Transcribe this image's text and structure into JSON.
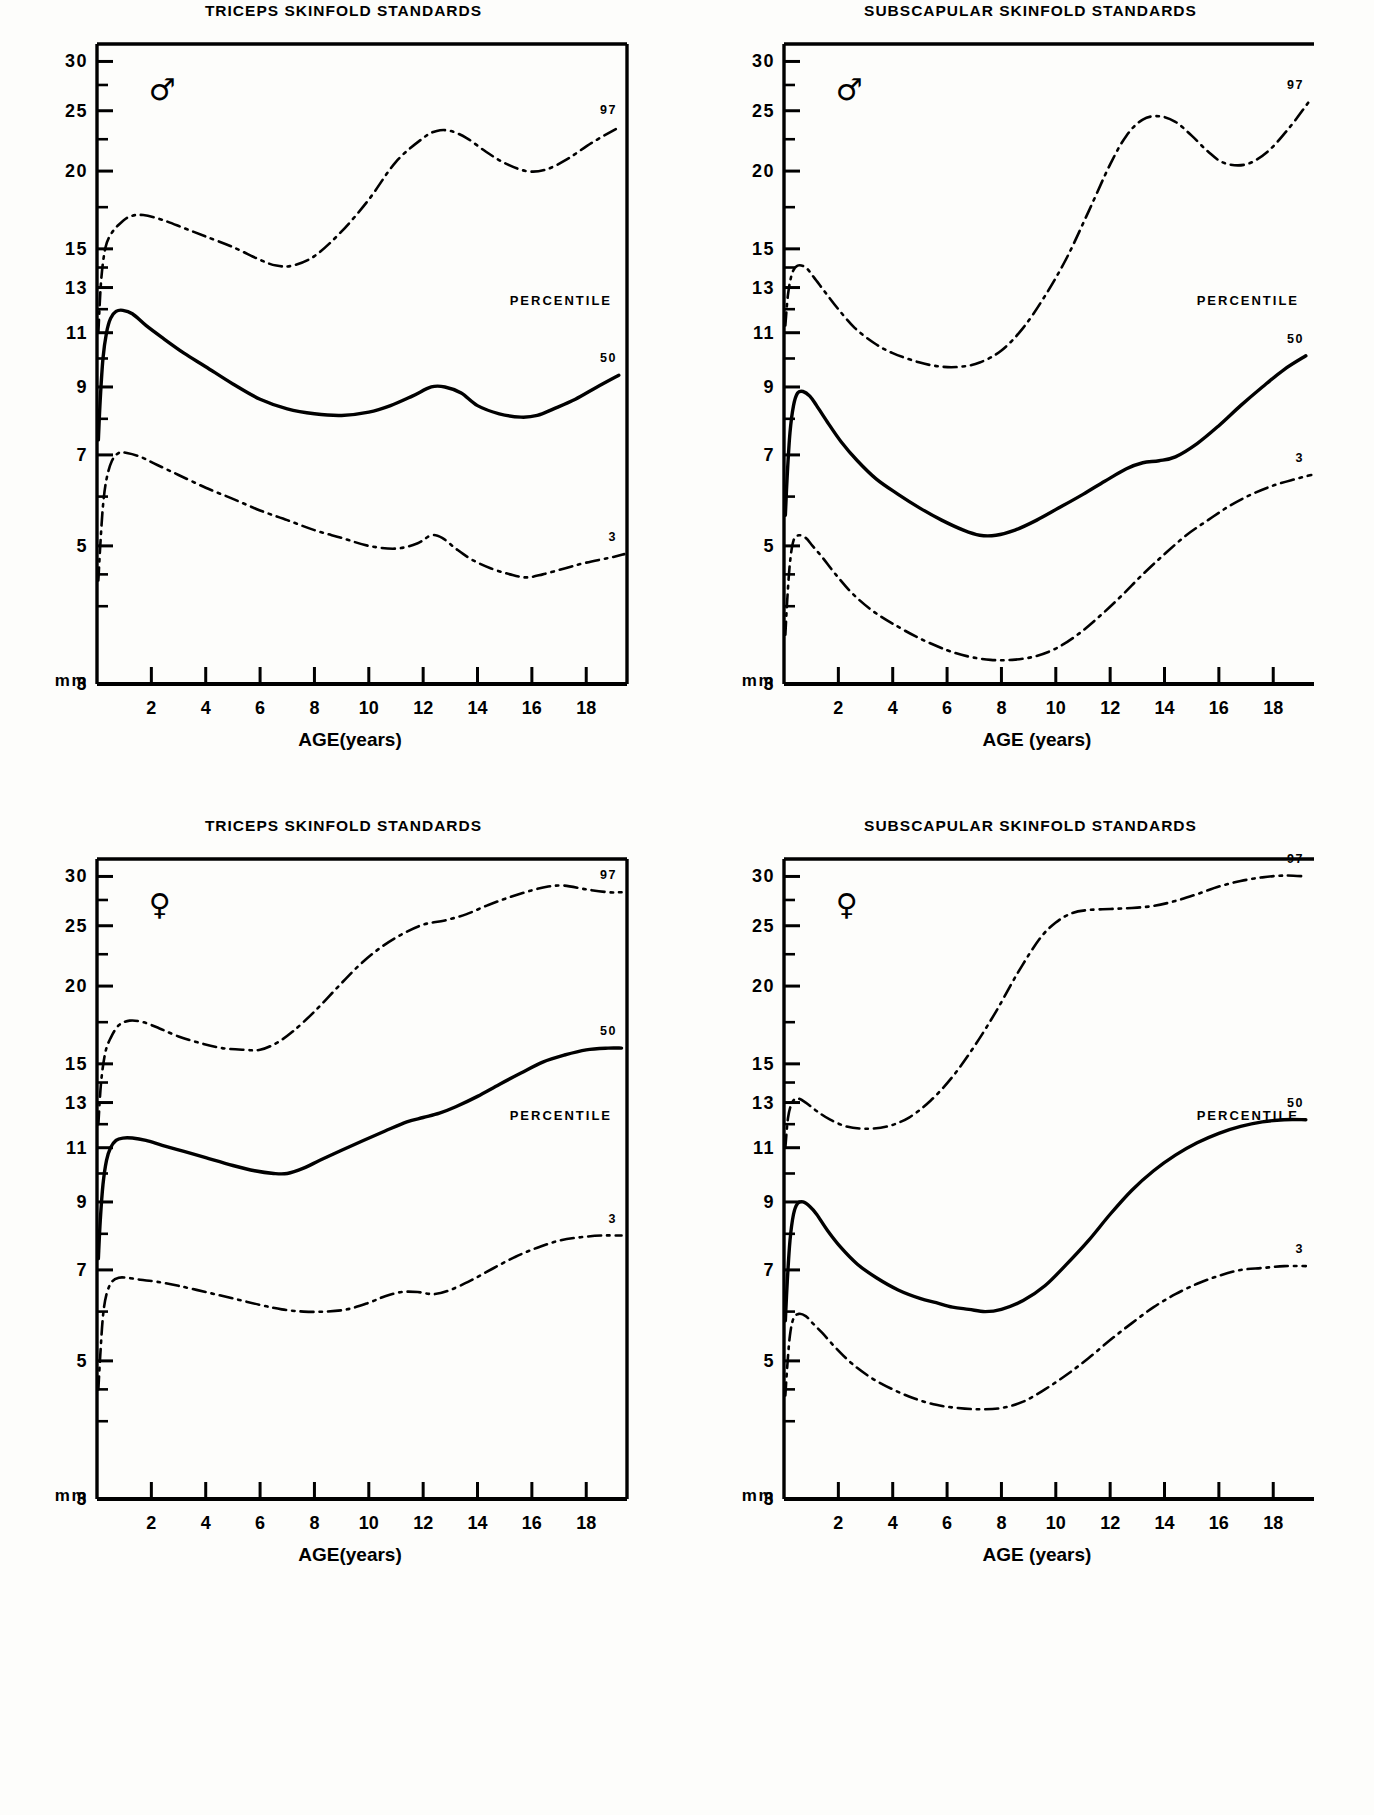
{
  "figure": {
    "unit_label": "mm",
    "percentile_word": "PERCENTILE",
    "male_symbol": "♂",
    "female_symbol": "♀",
    "y_tick_labels": [
      "30",
      "25",
      "20",
      "15",
      "13",
      "11",
      "9",
      "7",
      "5",
      "3"
    ],
    "y_tick_values": [
      30,
      25,
      20,
      15,
      13,
      11,
      9,
      7,
      5,
      3
    ],
    "x_tick_labels": [
      "2",
      "4",
      "6",
      "8",
      "10",
      "12",
      "14",
      "16",
      "18"
    ],
    "x_tick_values": [
      2,
      4,
      6,
      8,
      10,
      12,
      14,
      16,
      18
    ],
    "line_color": "#000000"
  },
  "panels": [
    {
      "id": "triceps-male",
      "title": "TRICEPS  SKINFOLD  STANDARDS",
      "sex": "♂",
      "sex_name": "male",
      "xaxis_title": "AGE(years)",
      "labels": {
        "p97": "97",
        "p50": "50",
        "p3": "3",
        "percentile": "PERCENTILE"
      }
    },
    {
      "id": "subscapular-male",
      "title": "SUBSCAPULAR  SKINFOLD  STANDARDS",
      "sex": "♂",
      "sex_name": "male",
      "xaxis_title": "AGE (years)",
      "labels": {
        "p97": "97",
        "p50": "50",
        "p3": "3",
        "percentile": "PERCENTILE"
      }
    },
    {
      "id": "triceps-female",
      "title": "TRICEPS  SKINFOLD  STANDARDS",
      "sex": "♀",
      "sex_name": "female",
      "xaxis_title": "AGE(years)",
      "labels": {
        "p97": "97",
        "p50": "50",
        "p3": "3",
        "percentile": "PERCENTILE"
      }
    },
    {
      "id": "subscapular-female",
      "title": "SUBSCAPULAR  SKINFOLD  STANDARDS",
      "sex": "♀",
      "sex_name": "female",
      "xaxis_title": "AGE (years)",
      "labels": {
        "p97": "97",
        "p50": "50",
        "p3": "3",
        "percentile": "PERCENTILE"
      }
    }
  ],
  "chart_data": [
    {
      "type": "line",
      "title": "TRICEPS  SKINFOLD  STANDARDS",
      "subtitle": "male",
      "xlabel": "AGE(years)",
      "ylabel": "mm",
      "xlim": [
        0,
        19.5
      ],
      "ylim": [
        3,
        32
      ],
      "yscale": "log",
      "grid": false,
      "legend": "right-inline",
      "xticks": [
        2,
        4,
        6,
        8,
        10,
        12,
        14,
        16,
        18
      ],
      "yticks": [
        3,
        5,
        7,
        9,
        11,
        13,
        15,
        20,
        25,
        30
      ],
      "series": [
        {
          "name": "97",
          "style": "dash-dot",
          "x": [
            0.05,
            0.15,
            0.3,
            0.5,
            0.8,
            1.2,
            1.7,
            2.4,
            3.2,
            4,
            5,
            6,
            6.6,
            7.2,
            8,
            9,
            10,
            11,
            12,
            12.5,
            13,
            13.6,
            14.3,
            15,
            15.8,
            16.5,
            17.3,
            18.2,
            19.2
          ],
          "y": [
            11.0,
            13.3,
            15.0,
            15.8,
            16.4,
            16.9,
            17.0,
            16.7,
            16.2,
            15.7,
            15.1,
            14.4,
            14.1,
            14.1,
            14.6,
            16.0,
            18.0,
            20.7,
            22.6,
            23.2,
            23.2,
            22.6,
            21.5,
            20.6,
            20.0,
            20.1,
            20.9,
            22.2,
            23.5
          ]
        },
        {
          "name": "50",
          "style": "solid",
          "x": [
            0.05,
            0.12,
            0.22,
            0.35,
            0.5,
            0.7,
            0.95,
            1.3,
            1.8,
            2.4,
            3.2,
            4,
            5,
            6,
            7,
            8,
            9,
            10,
            10.8,
            11.6,
            12.3,
            12.8,
            13.4,
            14,
            14.8,
            15.6,
            16.2,
            16.8,
            17.6,
            18.4,
            19.2
          ],
          "y": [
            7.4,
            8.6,
            10.0,
            11.0,
            11.6,
            11.9,
            11.95,
            11.8,
            11.3,
            10.8,
            10.2,
            9.7,
            9.1,
            8.6,
            8.3,
            8.15,
            8.1,
            8.2,
            8.4,
            8.7,
            9.0,
            9.0,
            8.8,
            8.4,
            8.15,
            8.05,
            8.1,
            8.3,
            8.6,
            9.0,
            9.4
          ]
        },
        {
          "name": "3",
          "style": "dash-dot",
          "x": [
            0.05,
            0.12,
            0.22,
            0.35,
            0.55,
            0.8,
            1.1,
            1.6,
            2.2,
            3,
            4,
            5,
            6,
            7,
            8,
            9,
            10,
            11,
            11.8,
            12.3,
            12.7,
            13.2,
            13.8,
            14.5,
            15.2,
            15.8,
            16.4,
            17.2,
            18,
            19,
            19.4
          ],
          "y": [
            4.4,
            5.0,
            5.8,
            6.4,
            6.85,
            7.05,
            7.05,
            6.95,
            6.75,
            6.5,
            6.2,
            5.95,
            5.7,
            5.5,
            5.3,
            5.15,
            5.0,
            4.95,
            5.05,
            5.2,
            5.15,
            4.95,
            4.75,
            4.6,
            4.5,
            4.45,
            4.5,
            4.6,
            4.7,
            4.8,
            4.85
          ]
        }
      ]
    },
    {
      "type": "line",
      "title": "SUBSCAPULAR  SKINFOLD  STANDARDS",
      "subtitle": "male",
      "xlabel": "AGE (years)",
      "ylabel": "mm",
      "xlim": [
        0,
        19.5
      ],
      "ylim": [
        3,
        32
      ],
      "yscale": "log",
      "grid": false,
      "legend": "right-inline",
      "xticks": [
        2,
        4,
        6,
        8,
        10,
        12,
        14,
        16,
        18
      ],
      "yticks": [
        3,
        5,
        7,
        9,
        11,
        13,
        15,
        20,
        25,
        30
      ],
      "series": [
        {
          "name": "97",
          "style": "dash-dot",
          "x": [
            0.05,
            0.15,
            0.3,
            0.5,
            0.8,
            1.1,
            1.5,
            2,
            2.6,
            3.3,
            4,
            5,
            5.8,
            6.5,
            7.2,
            8,
            8.8,
            9.6,
            10.4,
            11.2,
            12,
            12.6,
            13.2,
            13.8,
            14.4,
            15,
            15.6,
            16.2,
            17,
            17.8,
            18.6,
            19.3
          ],
          "y": [
            11.3,
            12.7,
            13.7,
            14.1,
            14.0,
            13.5,
            12.8,
            12.0,
            11.2,
            10.6,
            10.2,
            9.85,
            9.7,
            9.7,
            9.85,
            10.3,
            11.2,
            12.6,
            14.5,
            17.2,
            20.5,
            22.8,
            24.2,
            24.5,
            24.0,
            22.8,
            21.5,
            20.6,
            20.5,
            21.5,
            23.5,
            25.8
          ]
        },
        {
          "name": "50",
          "style": "solid",
          "x": [
            0.05,
            0.12,
            0.22,
            0.35,
            0.5,
            0.7,
            0.95,
            1.2,
            1.6,
            2.1,
            2.7,
            3.4,
            4.2,
            5,
            5.8,
            6.6,
            7.2,
            7.8,
            8.5,
            9.3,
            10.1,
            11,
            11.8,
            12.6,
            13.2,
            13.8,
            14.4,
            15.2,
            16,
            16.8,
            17.6,
            18.4,
            19.2
          ],
          "y": [
            5.6,
            6.5,
            7.6,
            8.4,
            8.8,
            8.85,
            8.7,
            8.4,
            7.9,
            7.35,
            6.85,
            6.4,
            6.05,
            5.75,
            5.5,
            5.3,
            5.2,
            5.2,
            5.3,
            5.5,
            5.75,
            6.05,
            6.35,
            6.65,
            6.8,
            6.85,
            6.95,
            7.3,
            7.8,
            8.4,
            9.0,
            9.6,
            10.1
          ]
        },
        {
          "name": "3",
          "style": "dash-dot",
          "x": [
            0.05,
            0.12,
            0.22,
            0.35,
            0.55,
            0.8,
            1.05,
            1.4,
            1.9,
            2.5,
            3.2,
            4,
            5,
            6,
            6.8,
            7.6,
            8.4,
            9.2,
            10,
            10.8,
            11.6,
            12.4,
            13.2,
            14,
            14.8,
            15.6,
            16.4,
            17.2,
            18,
            18.8,
            19.4
          ],
          "y": [
            3.6,
            4.1,
            4.7,
            5.1,
            5.2,
            5.15,
            5.0,
            4.8,
            4.5,
            4.2,
            3.95,
            3.75,
            3.55,
            3.4,
            3.32,
            3.28,
            3.28,
            3.32,
            3.42,
            3.6,
            3.85,
            4.15,
            4.5,
            4.85,
            5.2,
            5.5,
            5.8,
            6.05,
            6.25,
            6.4,
            6.5
          ]
        }
      ]
    },
    {
      "type": "line",
      "title": "TRICEPS  SKINFOLD  STANDARDS",
      "subtitle": "female",
      "xlabel": "AGE(years)",
      "ylabel": "mm",
      "xlim": [
        0,
        19.5
      ],
      "ylim": [
        3,
        32
      ],
      "yscale": "log",
      "grid": false,
      "legend": "right-inline",
      "xticks": [
        2,
        4,
        6,
        8,
        10,
        12,
        14,
        16,
        18
      ],
      "yticks": [
        3,
        5,
        7,
        9,
        11,
        13,
        15,
        20,
        25,
        30
      ],
      "series": [
        {
          "name": "97",
          "style": "dash-dot",
          "x": [
            0.05,
            0.15,
            0.3,
            0.5,
            0.8,
            1.2,
            1.7,
            2.3,
            3,
            3.8,
            4.6,
            5.4,
            6,
            6.6,
            7.2,
            8,
            8.8,
            9.6,
            10.4,
            11.2,
            12,
            12.8,
            13.6,
            14.4,
            15.2,
            16,
            16.6,
            17.2,
            18,
            18.8,
            19.3
          ],
          "y": [
            12.0,
            14.0,
            15.6,
            16.5,
            17.3,
            17.6,
            17.5,
            17.1,
            16.6,
            16.2,
            15.9,
            15.8,
            15.8,
            16.2,
            16.9,
            18.2,
            19.8,
            21.5,
            23.0,
            24.2,
            25.1,
            25.5,
            26.1,
            27.0,
            27.8,
            28.5,
            28.9,
            29.0,
            28.6,
            28.3,
            28.3
          ]
        },
        {
          "name": "50",
          "style": "solid",
          "x": [
            0.05,
            0.12,
            0.22,
            0.35,
            0.5,
            0.7,
            0.95,
            1.3,
            1.8,
            2.4,
            3.2,
            4,
            5,
            5.8,
            6.5,
            7,
            7.6,
            8.2,
            9,
            9.8,
            10.6,
            11.4,
            12,
            12.6,
            13.2,
            14,
            14.8,
            15.6,
            16.4,
            17.2,
            18,
            18.8,
            19.3
          ],
          "y": [
            7.3,
            8.4,
            9.6,
            10.5,
            11.0,
            11.3,
            11.4,
            11.4,
            11.3,
            11.1,
            10.85,
            10.6,
            10.3,
            10.1,
            10.0,
            10.0,
            10.2,
            10.5,
            10.9,
            11.3,
            11.7,
            12.1,
            12.3,
            12.5,
            12.8,
            13.3,
            13.9,
            14.5,
            15.1,
            15.5,
            15.8,
            15.9,
            15.9
          ]
        },
        {
          "name": "3",
          "style": "dash-dot",
          "x": [
            0.05,
            0.12,
            0.22,
            0.35,
            0.55,
            0.8,
            1.1,
            1.6,
            2.2,
            3,
            4,
            5,
            6,
            6.8,
            7.6,
            8.4,
            9.2,
            10,
            10.6,
            11.2,
            11.8,
            12.4,
            13,
            13.8,
            14.6,
            15.4,
            16.2,
            17,
            17.8,
            18.6,
            19.3
          ],
          "y": [
            4.5,
            5.1,
            5.9,
            6.4,
            6.7,
            6.8,
            6.8,
            6.75,
            6.7,
            6.6,
            6.45,
            6.3,
            6.15,
            6.05,
            6.0,
            6.0,
            6.05,
            6.2,
            6.35,
            6.45,
            6.45,
            6.4,
            6.5,
            6.75,
            7.05,
            7.35,
            7.6,
            7.8,
            7.9,
            7.95,
            7.95
          ]
        }
      ]
    },
    {
      "type": "line",
      "title": "SUBSCAPULAR  SKINFOLD  STANDARDS",
      "subtitle": "female",
      "xlabel": "AGE (years)",
      "ylabel": "mm",
      "xlim": [
        0,
        19.5
      ],
      "ylim": [
        3,
        32
      ],
      "yscale": "log",
      "grid": false,
      "legend": "right-inline",
      "xticks": [
        2,
        4,
        6,
        8,
        10,
        12,
        14,
        16,
        18
      ],
      "yticks": [
        3,
        5,
        7,
        9,
        11,
        13,
        15,
        20,
        25,
        30
      ],
      "series": [
        {
          "name": "97",
          "style": "dash-dot",
          "x": [
            0.05,
            0.15,
            0.3,
            0.5,
            0.8,
            1.2,
            1.7,
            2.3,
            3,
            3.8,
            4.6,
            5.4,
            6.2,
            7,
            7.8,
            8.6,
            9.4,
            10,
            10.6,
            11.2,
            12,
            12.8,
            13.6,
            14.4,
            15.2,
            16,
            16.8,
            17.6,
            18.4,
            19.2
          ],
          "y": [
            11.0,
            12.3,
            13.0,
            13.2,
            13.0,
            12.6,
            12.2,
            11.9,
            11.8,
            11.9,
            12.3,
            13.1,
            14.3,
            16.0,
            18.2,
            21.0,
            23.8,
            25.3,
            26.2,
            26.5,
            26.6,
            26.7,
            26.9,
            27.4,
            28.1,
            28.9,
            29.5,
            29.9,
            30.1,
            30.0
          ]
        },
        {
          "name": "50",
          "style": "solid",
          "x": [
            0.05,
            0.12,
            0.22,
            0.35,
            0.5,
            0.7,
            0.95,
            1.2,
            1.6,
            2.1,
            2.7,
            3.4,
            4.2,
            5,
            5.6,
            6.2,
            6.8,
            7.4,
            8,
            8.8,
            9.6,
            10.4,
            11.2,
            12,
            12.8,
            13.6,
            14.4,
            15.2,
            16,
            16.8,
            17.6,
            18.4,
            19.2
          ],
          "y": [
            5.8,
            6.7,
            7.8,
            8.6,
            8.95,
            9.0,
            8.85,
            8.6,
            8.1,
            7.6,
            7.15,
            6.8,
            6.5,
            6.3,
            6.2,
            6.1,
            6.05,
            6.0,
            6.05,
            6.25,
            6.6,
            7.15,
            7.8,
            8.6,
            9.4,
            10.1,
            10.7,
            11.2,
            11.6,
            11.9,
            12.1,
            12.2,
            12.2
          ]
        },
        {
          "name": "3",
          "style": "dash-dot",
          "x": [
            0.05,
            0.12,
            0.22,
            0.35,
            0.55,
            0.8,
            1.05,
            1.4,
            1.9,
            2.5,
            3.2,
            4,
            4.8,
            5.6,
            6.4,
            7.2,
            8,
            8.8,
            9.6,
            10.4,
            11.2,
            12,
            12.8,
            13.6,
            14.4,
            15.2,
            16,
            16.8,
            17.6,
            18.4,
            19.2
          ],
          "y": [
            4.4,
            4.9,
            5.5,
            5.85,
            5.95,
            5.9,
            5.75,
            5.55,
            5.25,
            4.95,
            4.7,
            4.5,
            4.35,
            4.25,
            4.2,
            4.18,
            4.2,
            4.3,
            4.5,
            4.75,
            5.05,
            5.4,
            5.75,
            6.1,
            6.4,
            6.65,
            6.85,
            7.0,
            7.05,
            7.1,
            7.1
          ]
        }
      ]
    }
  ]
}
